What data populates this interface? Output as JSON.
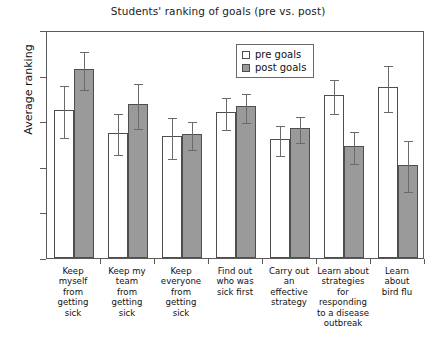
{
  "chart_data": {
    "type": "bar",
    "title": "Students' ranking of goals (pre vs. post)",
    "xlabel": "",
    "ylabel": "Average ranking",
    "ylim": [
      0,
      5
    ],
    "yticks": [
      "0",
      "1",
      "2",
      "3",
      "4",
      "5"
    ],
    "grid": false,
    "legend_position": "top-right",
    "categories": [
      "Keep myself from getting sick",
      "Keep my team from getting sick",
      "Keep everyone from getting sick",
      "Find out who was sick first",
      "Carry out an effective strategy",
      "Learn about strategies for responding to a disease outbreak",
      "Learn about bird flu"
    ],
    "category_lines": [
      [
        "Keep",
        "myself",
        "from",
        "getting",
        "sick"
      ],
      [
        "Keep my",
        "team",
        "from",
        "getting",
        "sick"
      ],
      [
        "Keep",
        "everyone",
        "from",
        "getting",
        "sick"
      ],
      [
        "Find out",
        "who was",
        "sick first"
      ],
      [
        "Carry out",
        "an",
        "effective",
        "strategy"
      ],
      [
        "Learn about",
        "strategies",
        "for",
        "responding",
        "to a disease",
        "outbreak"
      ],
      [
        "Learn",
        "about",
        "bird flu"
      ]
    ],
    "series": [
      {
        "name": "pre goals",
        "color": "#ffffff",
        "values": [
          3.25,
          2.75,
          2.67,
          3.2,
          2.6,
          3.57,
          3.75
        ],
        "errors": [
          0.57,
          0.45,
          0.45,
          0.35,
          0.33,
          0.37,
          0.5
        ]
      },
      {
        "name": "post goals",
        "color": "#9a9a9a",
        "values": [
          4.15,
          3.37,
          2.72,
          3.33,
          2.85,
          2.45,
          2.05
        ],
        "errors": [
          0.42,
          0.5,
          0.3,
          0.32,
          0.28,
          0.35,
          0.55
        ]
      }
    ]
  },
  "legend": {
    "items": [
      {
        "label": "pre goals"
      },
      {
        "label": "post goals"
      }
    ]
  }
}
